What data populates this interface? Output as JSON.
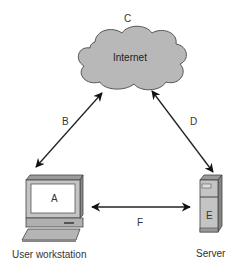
{
  "diagram": {
    "type": "network",
    "nodes": [
      {
        "id": "internet",
        "label": "Internet",
        "letter": "C",
        "shape": "cloud"
      },
      {
        "id": "workstation",
        "label": "User workstation",
        "letter": "A",
        "shape": "computer"
      },
      {
        "id": "server",
        "label": "Server",
        "letter": "E",
        "shape": "server-tower"
      }
    ],
    "edges": [
      {
        "from": "workstation",
        "to": "internet",
        "label": "B",
        "direction": "bidirectional"
      },
      {
        "from": "internet",
        "to": "server",
        "label": "D",
        "direction": "bidirectional"
      },
      {
        "from": "workstation",
        "to": "server",
        "label": "F",
        "direction": "bidirectional"
      }
    ]
  },
  "labels": {
    "cloud_letter": "C",
    "cloud_text": "Internet",
    "edge_b": "B",
    "edge_d": "D",
    "edge_f": "F",
    "workstation_letter": "A",
    "workstation_caption": "User workstation",
    "server_letter": "E",
    "server_caption": "Server"
  },
  "colors": {
    "cloud_fill": "#b8b8b8",
    "device_fill": "#c4c4c4",
    "screen_fill": "#ffffff",
    "stroke": "#333333"
  }
}
